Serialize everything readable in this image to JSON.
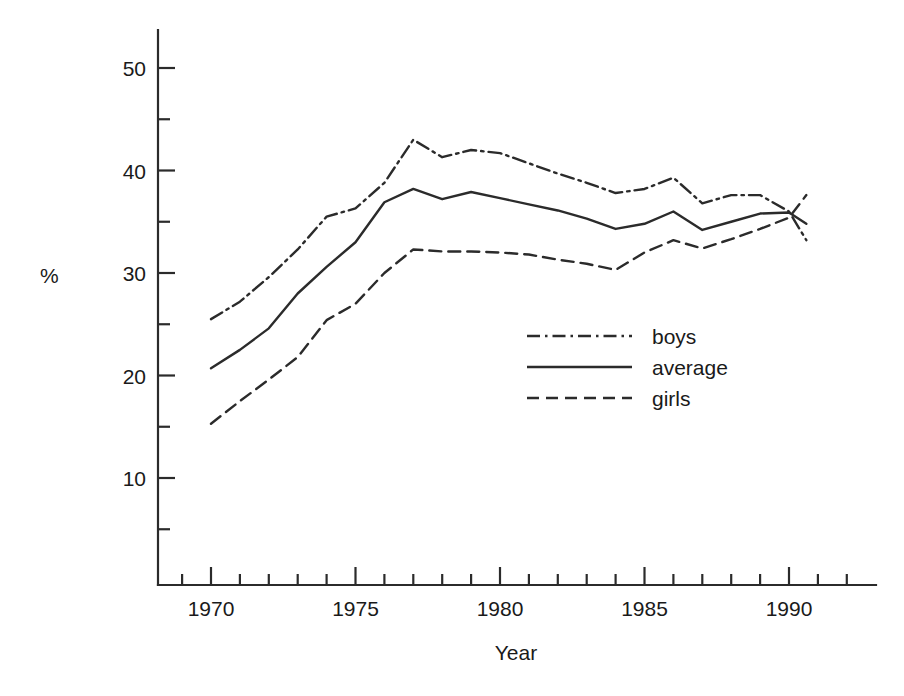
{
  "chart_data": {
    "type": "line",
    "title": "",
    "xlabel": "Year",
    "ylabel": "%",
    "xlim": [
      1968.2,
      1992.5
    ],
    "ylim": [
      0,
      53.5
    ],
    "grid": false,
    "legend_position": "center",
    "x_major_ticks": [
      1970,
      1975,
      1980,
      1985,
      1990
    ],
    "x_major_tick_labels": [
      "1970",
      "1975",
      "1980",
      "1985",
      "1990"
    ],
    "x_minor_tick_interval": 1,
    "y_major_ticks": [
      10,
      20,
      30,
      40,
      50
    ],
    "y_major_tick_labels": [
      "10",
      "20",
      "30",
      "40",
      "50"
    ],
    "y_minor_ticks": [
      5,
      15,
      25,
      35,
      45
    ],
    "x": [
      1970,
      1971,
      1972,
      1973,
      1974,
      1975,
      1976,
      1977,
      1978,
      1979,
      1980,
      1981,
      1982,
      1983,
      1984,
      1985,
      1986,
      1987,
      1988,
      1989,
      1990,
      1990.6
    ],
    "series": [
      {
        "name": "boys",
        "style": "dash-dot",
        "color": "#2b2b2b",
        "values": [
          25.5,
          27.2,
          29.6,
          32.3,
          35.5,
          36.3,
          38.8,
          43.0,
          41.3,
          42.0,
          41.7,
          40.7,
          39.7,
          38.8,
          37.8,
          38.2,
          39.3,
          36.8,
          37.6,
          37.6,
          36.0,
          33.2
        ]
      },
      {
        "name": "average",
        "style": "solid",
        "color": "#2b2b2b",
        "values": [
          20.7,
          22.5,
          24.6,
          28.0,
          30.6,
          33.0,
          36.9,
          38.2,
          37.2,
          37.9,
          37.3,
          36.7,
          36.1,
          35.3,
          34.3,
          34.8,
          36.0,
          34.2,
          35.0,
          35.8,
          35.9,
          34.8
        ]
      },
      {
        "name": "girls",
        "style": "dashed",
        "color": "#2b2b2b",
        "values": [
          15.3,
          17.5,
          19.6,
          21.8,
          25.4,
          27.0,
          30.0,
          32.3,
          32.1,
          32.1,
          32.0,
          31.8,
          31.3,
          30.9,
          30.3,
          32.0,
          33.2,
          32.4,
          33.3,
          34.3,
          35.4,
          37.6
        ]
      }
    ]
  },
  "legend": {
    "entries": [
      {
        "label": "boys",
        "style": "dash-dot"
      },
      {
        "label": "average",
        "style": "solid"
      },
      {
        "label": "girls",
        "style": "dashed"
      }
    ]
  },
  "labels": {
    "ylabel": "%",
    "xlabel": "Year"
  }
}
